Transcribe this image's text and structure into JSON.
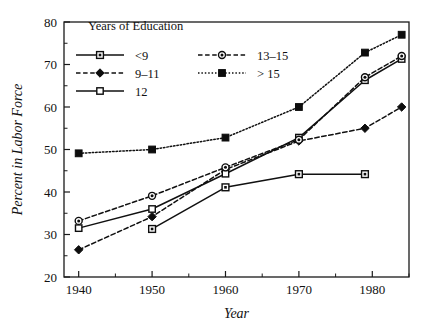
{
  "chart_data": {
    "type": "line",
    "title": "",
    "xlabel": "Year",
    "ylabel": "Percent in Labor Force",
    "xlim": [
      1938,
      1985
    ],
    "ylim": [
      20,
      80
    ],
    "grid": false,
    "legend_position": "top-left inside plot",
    "legend_title": "Years of Education",
    "x_major_ticks": [
      1940,
      1950,
      1960,
      1970,
      1980
    ],
    "x_major_tick_labels": [
      "1940",
      "1950",
      "1960",
      "1970",
      "1980"
    ],
    "x_minor_ticks": [
      1945,
      1955,
      1965,
      1975,
      1985
    ],
    "y_major_ticks": [
      20,
      30,
      40,
      50,
      60,
      70,
      80
    ],
    "y_major_tick_labels": [
      "20",
      "30",
      "40",
      "50",
      "60",
      "70",
      "80"
    ],
    "y_minor_ticks": [
      25,
      35,
      45,
      55,
      65,
      75
    ],
    "series": [
      {
        "name": "<9",
        "marker": "square-dotted-center",
        "dash": "none",
        "x": [
          1950,
          1960,
          1970,
          1979
        ],
        "values": [
          31.3,
          41.1,
          44.2,
          44.2
        ]
      },
      {
        "name": "9–11",
        "marker": "diamond-filled",
        "dash": "dashed",
        "x": [
          1940,
          1950,
          1960,
          1970,
          1979,
          1984
        ],
        "values": [
          26.4,
          34.2,
          45.3,
          52.0,
          55.0,
          60.0
        ]
      },
      {
        "name": "12",
        "marker": "square-open",
        "dash": "none",
        "x": [
          1940,
          1950,
          1960,
          1970,
          1979,
          1984
        ],
        "values": [
          31.5,
          36.0,
          44.3,
          52.8,
          66.3,
          71.3
        ]
      },
      {
        "name": "13–15",
        "marker": "circle-dot",
        "dash": "dashed",
        "x": [
          1940,
          1950,
          1960,
          1970,
          1979,
          1984
        ],
        "values": [
          33.2,
          39.1,
          45.8,
          52.3,
          67.0,
          72.0
        ]
      },
      {
        "name": "> 15",
        "marker": "square-filled",
        "dash": "dotted",
        "x": [
          1940,
          1950,
          1960,
          1970,
          1979,
          1984
        ],
        "values": [
          49.1,
          50.0,
          52.8,
          60.0,
          72.8,
          77.0
        ]
      }
    ],
    "legend_entries": [
      {
        "label": "<9",
        "column": 0,
        "row": 0
      },
      {
        "label": "9–11",
        "column": 0,
        "row": 1
      },
      {
        "label": "12",
        "column": 0,
        "row": 2
      },
      {
        "label": "13–15",
        "column": 1,
        "row": 0
      },
      {
        "label": "> 15",
        "column": 1,
        "row": 1
      }
    ],
    "colors": {
      "ink": "#101010",
      "background": "#ffffff"
    }
  }
}
